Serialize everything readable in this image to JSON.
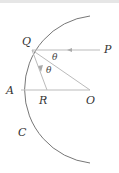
{
  "diagram": {
    "type": "geometry-optics",
    "labels": {
      "Q": "Q",
      "P": "P",
      "A": "A",
      "R": "R",
      "O": "O",
      "C": "C",
      "theta1": "θ",
      "theta2": "θ"
    },
    "elements": [
      "arc-mirror",
      "incident-ray-P-to-Q",
      "radius-Q-to-O",
      "reflected-ray-Q-to-R",
      "axis-A-to-O"
    ],
    "colors": {
      "arc": "#777777",
      "rays": "#bbbbbb",
      "text": "#333333"
    }
  }
}
